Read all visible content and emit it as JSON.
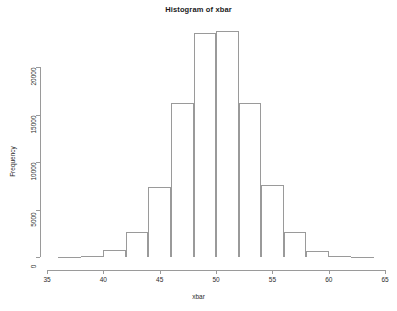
{
  "chart_data": {
    "type": "bar",
    "title": "Histogram of xbar",
    "xlabel": "xbar",
    "ylabel": "Frequency",
    "xlim": [
      35,
      65
    ],
    "ylim": [
      0,
      24200
    ],
    "grid": false,
    "legend": null,
    "bin_width": 2,
    "bin_edges": [
      36,
      38,
      40,
      42,
      44,
      46,
      48,
      50,
      52,
      54,
      56,
      58,
      60,
      62,
      64
    ],
    "categories": [
      "36-38",
      "38-40",
      "40-42",
      "42-44",
      "44-46",
      "46-48",
      "48-50",
      "50-52",
      "52-54",
      "54-56",
      "56-58",
      "58-60",
      "60-62",
      "62-64"
    ],
    "values": [
      30,
      120,
      720,
      2630,
      7370,
      16200,
      23600,
      23800,
      16200,
      7580,
      2630,
      580,
      120,
      30
    ],
    "xticks": [
      35,
      40,
      45,
      50,
      55,
      60,
      65
    ],
    "xtick_labels": [
      "35",
      "40",
      "45",
      "50",
      "55",
      "60",
      "65"
    ],
    "yticks": [
      0,
      5000,
      10000,
      15000,
      20000
    ],
    "ytick_labels": [
      "0",
      "5000",
      "10000",
      "15000",
      "20000"
    ],
    "axis_color": "#9a9a9a",
    "text_color": "#2b2b2b",
    "bar_fill": "transparent",
    "bar_stroke": "#9a9a9a",
    "background": "#ffffff"
  }
}
